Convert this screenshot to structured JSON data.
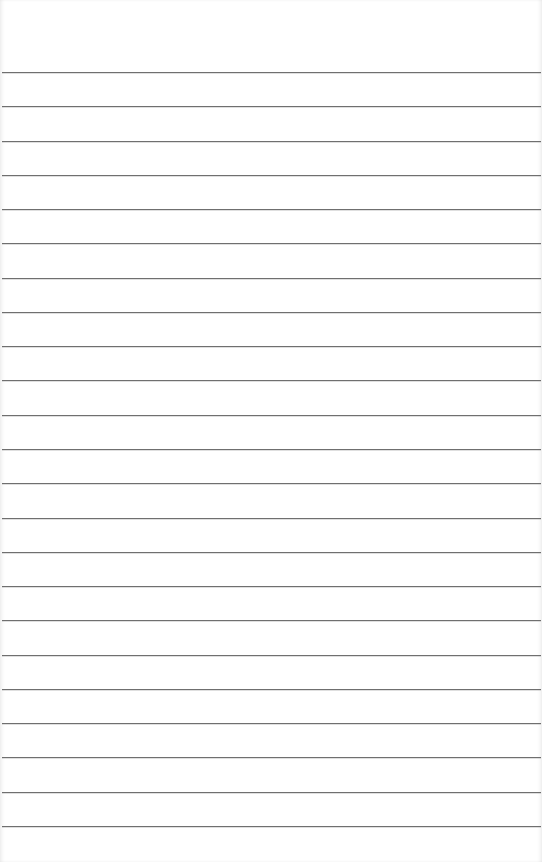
{
  "page": {
    "type": "lined-paper",
    "background_color": "#ffffff",
    "rule_color": "#6f6f6f",
    "rule_count": 23,
    "first_rule_y": 72,
    "rule_spacing": 34.27,
    "text": ""
  }
}
